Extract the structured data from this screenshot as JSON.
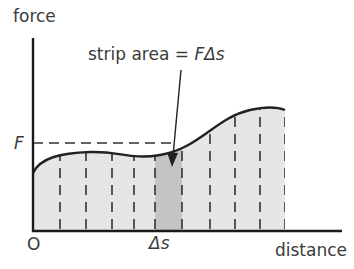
{
  "diagram": {
    "y_axis_label": "force",
    "x_axis_label": "distance",
    "origin_label": "O",
    "force_level_label": "F",
    "strip_width_label": "Δs",
    "annotation": {
      "prefix": "strip area = ",
      "formula": "FΔs"
    },
    "colors": {
      "axis": "#1a1a1a",
      "curve": "#222222",
      "area_fill": "#e6e6e6",
      "strip_fill": "#c4c4c4",
      "dashed": "#333333",
      "text": "#3a3a3a"
    },
    "strip_boundaries_x": [
      60,
      86,
      112,
      134,
      155,
      182,
      210,
      235,
      260,
      285
    ]
  }
}
